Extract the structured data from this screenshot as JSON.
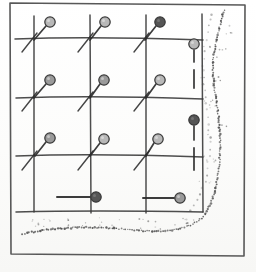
{
  "document": {
    "title": "Hand-drawn survey grid map",
    "medium": "pen-and-ink sketch",
    "canvas": {
      "width": 256,
      "height": 272
    }
  },
  "colors": {
    "ink": "#2b2b2b",
    "grid_line": "#3a3a3a",
    "frame_line": "#4a4a4a",
    "pin_light": "#b8b8b8",
    "pin_medium": "#9a9a9a",
    "pin_dark": "#555555",
    "pin_outline": "#3a3a3a",
    "stipple": "#4d4d4d",
    "paper": "#fdfdfc"
  },
  "frame": {
    "name": "outer-frame",
    "points": "10,3 245,5 244,256 11,254",
    "stroke_width": 1.6
  },
  "grid": {
    "label": "survey-grid",
    "columns": 4,
    "rows": 4,
    "stroke_width": 1.5,
    "vertical_lines": [
      {
        "id": "v1",
        "d": "M34,16 L34,212"
      },
      {
        "id": "v2",
        "d": "M90,15 L91,213"
      },
      {
        "id": "v3",
        "d": "M146,15 L146,213"
      },
      {
        "id": "v4",
        "d": "M202,14 L203,212"
      }
    ],
    "horizontal_lines": [
      {
        "id": "h1",
        "d": "M15,39 Q90,36 203,40"
      },
      {
        "id": "h2",
        "d": "M16,98 Q92,95 203,99"
      },
      {
        "id": "h3",
        "d": "M16,156 Q92,153 203,157"
      },
      {
        "id": "h4",
        "d": "M16,212 Q92,210 203,212"
      }
    ],
    "diagonal_ticks": [
      {
        "id": "t1",
        "d": "M22,52 L37,33"
      },
      {
        "id": "t2",
        "d": "M78,52 L93,33"
      },
      {
        "id": "t3",
        "d": "M134,52 L149,33"
      },
      {
        "id": "t4",
        "d": "M22,111 L37,92"
      },
      {
        "id": "t5",
        "d": "M78,111 L93,92"
      },
      {
        "id": "t6",
        "d": "M134,111 L149,92"
      },
      {
        "id": "t7",
        "d": "M22,170 L37,151"
      },
      {
        "id": "t8",
        "d": "M78,170 L93,151"
      },
      {
        "id": "t9",
        "d": "M134,170 L149,151"
      }
    ]
  },
  "markers": {
    "label": "pin-markers",
    "head_radius": 5.2,
    "items": [
      {
        "id": "pin-r1c1",
        "row": 1,
        "col": 1,
        "cx": 50,
        "cy": 22,
        "stem": "M46,26 L34,40",
        "shade": "pin_light",
        "orientation": "diagonal"
      },
      {
        "id": "pin-r1c2",
        "row": 1,
        "col": 2,
        "cx": 105,
        "cy": 22,
        "stem": "M101,26 L90,40",
        "shade": "pin_light",
        "orientation": "diagonal"
      },
      {
        "id": "pin-r1c3",
        "row": 1,
        "col": 3,
        "cx": 160,
        "cy": 22,
        "stem": "M156,26 L145,40",
        "shade": "pin_dark",
        "orientation": "diagonal"
      },
      {
        "id": "pin-r1c4",
        "row": 1,
        "col": 4,
        "cx": 194,
        "cy": 44,
        "stem": "M194,50 L194,62",
        "shade": "pin_light",
        "orientation": "vertical"
      },
      {
        "id": "pin-r2c1",
        "row": 2,
        "col": 1,
        "cx": 50,
        "cy": 80,
        "stem": "M46,84 L34,98",
        "shade": "pin_medium",
        "orientation": "diagonal"
      },
      {
        "id": "pin-r2c2",
        "row": 2,
        "col": 2,
        "cx": 104,
        "cy": 80,
        "stem": "M100,84 L90,98",
        "shade": "pin_medium",
        "orientation": "diagonal"
      },
      {
        "id": "pin-r2c3",
        "row": 2,
        "col": 3,
        "cx": 160,
        "cy": 80,
        "stem": "M156,84 L146,98",
        "shade": "pin_light",
        "orientation": "diagonal"
      },
      {
        "id": "pin-r3c1",
        "row": 3,
        "col": 1,
        "cx": 50,
        "cy": 138,
        "stem": "M46,142 L35,156",
        "shade": "pin_medium",
        "orientation": "diagonal"
      },
      {
        "id": "pin-r3c2",
        "row": 3,
        "col": 2,
        "cx": 104,
        "cy": 139,
        "stem": "M100,143 L90,156",
        "shade": "pin_light",
        "orientation": "diagonal"
      },
      {
        "id": "pin-r3c3",
        "row": 3,
        "col": 3,
        "cx": 158,
        "cy": 139,
        "stem": "M154,143 L146,156",
        "shade": "pin_light",
        "orientation": "diagonal"
      },
      {
        "id": "pin-r3c4",
        "row": 3,
        "col": 4,
        "cx": 194,
        "cy": 120,
        "stem": "M194,126 L194,140",
        "shade": "pin_dark",
        "orientation": "vertical"
      },
      {
        "id": "pin-r4c2",
        "row": 4,
        "col": 2,
        "cx": 96,
        "cy": 197,
        "stem": "M90,197 L57,197",
        "shade": "pin_dark",
        "orientation": "horizontal"
      },
      {
        "id": "pin-r4c3",
        "row": 4,
        "col": 3,
        "cx": 180,
        "cy": 198,
        "stem": "M174,198 L143,198",
        "shade": "pin_medium",
        "orientation": "horizontal"
      }
    ],
    "detached_segments": [
      {
        "id": "seg-r1c4",
        "d": "M194,70 L194,88"
      },
      {
        "id": "seg-r3c4",
        "d": "M194,148 L194,170"
      }
    ]
  },
  "stipple_boundary": {
    "label": "dotted-shoreline",
    "description": "stippled boundary curving down the right side and sweeping across the bottom",
    "dot_radius": 0.95,
    "main_path": "M224,10 C219,30 214,46 213,62 C212,80 216,96 218,112 C220,130 221,148 219,166 C217,186 213,202 204,216 C192,228 170,233 146,231 C120,229 96,226 70,228 C52,229 36,231 22,234",
    "secondary_path": "M212,14 C207,32 203,50 203,66 C203,84 206,100 208,116 C210,134 210,152 207,170 C204,188 198,204 188,214",
    "scatter_clusters": [
      {
        "id": "sc-1",
        "cx": 222,
        "cy": 30,
        "count": 5
      },
      {
        "id": "sc-2",
        "cx": 216,
        "cy": 52,
        "count": 6
      },
      {
        "id": "sc-3",
        "cx": 212,
        "cy": 78,
        "count": 5
      },
      {
        "id": "sc-4",
        "cx": 215,
        "cy": 104,
        "count": 6
      },
      {
        "id": "sc-5",
        "cx": 218,
        "cy": 130,
        "count": 5
      },
      {
        "id": "sc-6",
        "cx": 214,
        "cy": 158,
        "count": 5
      },
      {
        "id": "sc-7",
        "cx": 210,
        "cy": 186,
        "count": 4
      },
      {
        "id": "sc-8",
        "cx": 40,
        "cy": 222,
        "count": 9
      },
      {
        "id": "sc-9",
        "cx": 75,
        "cy": 224,
        "count": 8
      },
      {
        "id": "sc-10",
        "cx": 110,
        "cy": 222,
        "count": 6
      },
      {
        "id": "sc-11",
        "cx": 150,
        "cy": 224,
        "count": 7
      },
      {
        "id": "sc-12",
        "cx": 185,
        "cy": 222,
        "count": 7
      }
    ]
  }
}
